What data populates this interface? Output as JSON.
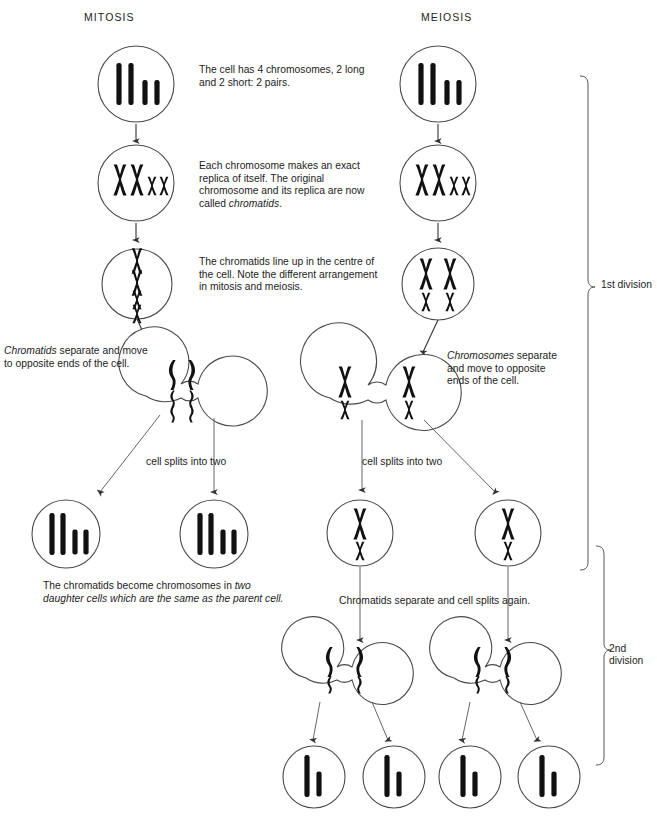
{
  "figure": {
    "type": "diagram",
    "columns": [
      {
        "id": "mitosis",
        "title": "MITOSIS"
      },
      {
        "id": "meiosis",
        "title": "MEIOSIS"
      }
    ]
  },
  "titles": {
    "mitosis": "MITOSIS",
    "meiosis": "MEIOSIS"
  },
  "notes": {
    "four_chromosomes": "The cell has 4 chromosomes, 2 long and 2 short: 2 pairs.",
    "replica_plain_1": "Each chromosome makes an exact replica of itself. The original chromosome and its replica are now called ",
    "replica_italic": "chromatids",
    "replica_plain_2": ".",
    "line_up": "The chromatids line up in the centre of the cell. Note the different arrangement in mitosis and meiosis.",
    "chromatids_separate_italic": "Chromatids",
    "chromatids_separate_plain": " separate and move to opposite ends of the cell.",
    "chromosomes_separate_italic": "Chromosomes",
    "chromosomes_separate_plain": " separate and move to opposite ends of the cell.",
    "cell_splits_left": "cell splits into two",
    "cell_splits_right": "cell splits into two",
    "daughter_plain": "The chromatids become chromosomes in ",
    "daughter_italic": "two daughter cells which are the same as the parent cell.",
    "split_again": "Chromatids separate and cell splits again."
  },
  "brackets": {
    "first_division": "1st division",
    "second_division": "2nd\ndivision"
  },
  "colors": {
    "ink": "#1a1a1a",
    "chromosome": "#111111",
    "cell_outline": "#4a4a4a",
    "arrow": "#444444",
    "background": "#ffffff"
  },
  "stages": {
    "mitosis": [
      {
        "name": "interphase",
        "contents": "2 long bars, 2 short bars"
      },
      {
        "name": "replication",
        "contents": "2 large X chromatid pairs, 2 small X chromatid pairs"
      },
      {
        "name": "metaphase",
        "contents": "4 X shapes stacked in a single central column"
      },
      {
        "name": "anaphase",
        "contents": "dumbbell cell, 4 curved chromatids on each side"
      },
      {
        "name": "daughter-cell-left",
        "contents": "2 long bars, 2 short bars"
      },
      {
        "name": "daughter-cell-right",
        "contents": "2 long bars, 2 short bars"
      }
    ],
    "meiosis": [
      {
        "name": "interphase",
        "contents": "2 long bars, 2 short bars"
      },
      {
        "name": "replication",
        "contents": "2 large X chromatid pairs, 2 small X chromatid pairs"
      },
      {
        "name": "metaphase-1",
        "contents": "2 large X side by side above 2 small X side by side"
      },
      {
        "name": "anaphase-1",
        "contents": "dumbbell cell, 1 large X and 1 small X each side"
      },
      {
        "name": "division-1-cell-left",
        "contents": "1 large X, 1 small X"
      },
      {
        "name": "division-1-cell-right",
        "contents": "1 large X, 1 small X"
      },
      {
        "name": "anaphase-2-left",
        "contents": "dumbbell cell, 1 long and 1 short chromatid each side"
      },
      {
        "name": "anaphase-2-right",
        "contents": "dumbbell cell, 1 long and 1 short chromatid each side"
      },
      {
        "name": "gamete-1",
        "contents": "1 long bar, 1 short bar"
      },
      {
        "name": "gamete-2",
        "contents": "1 long bar, 1 short bar"
      },
      {
        "name": "gamete-3",
        "contents": "1 long bar, 1 short bar"
      },
      {
        "name": "gamete-4",
        "contents": "1 long bar, 1 short bar"
      }
    ]
  }
}
